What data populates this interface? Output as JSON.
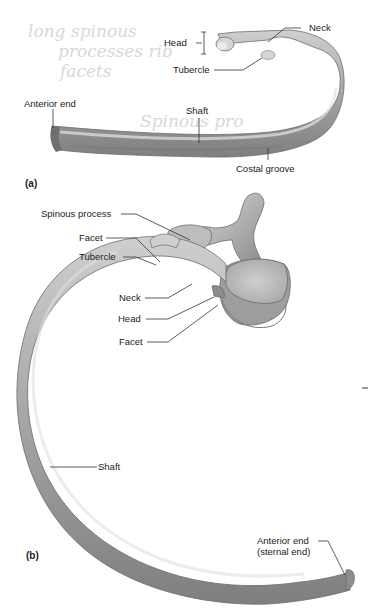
{
  "figure": {
    "panel_a": {
      "tag": "(a)",
      "labels": {
        "head": "Head",
        "neck": "Neck",
        "tubercle": "Tubercle",
        "anterior_end": "Anterior end",
        "shaft": "Shaft",
        "costal_groove": "Costal groove"
      }
    },
    "panel_b": {
      "tag": "(b)",
      "labels": {
        "spinous_process": "Spinous process",
        "facet_upper": "Facet",
        "tubercle": "Tubercle",
        "neck": "Neck",
        "head": "Head",
        "facet_lower": "Facet",
        "shaft": "Shaft",
        "anterior_end_line1": "Anterior end",
        "anterior_end_line2": "(sternal end)"
      }
    },
    "handwritten_notes": [
      "long spinous",
      "processes rib",
      "facets",
      "Spinous pro",
      "trans verten"
    ],
    "colors": {
      "bone_light": "#e6e6e6",
      "bone_mid": "#b9b9b9",
      "bone_dark": "#8a8a8a",
      "label_text": "#222222",
      "leader_line": "#333333",
      "handwriting": "#d8d8d8"
    }
  }
}
